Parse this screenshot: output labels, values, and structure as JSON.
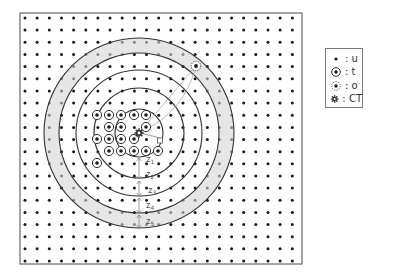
{
  "diagram": {
    "frame": {
      "x": 20,
      "y": 13,
      "width": 282,
      "height": 251
    },
    "grid": {
      "x0": 25,
      "y0": 18,
      "dx": 12.15,
      "dy": 12.15,
      "cols": 23,
      "rows": 21,
      "dot_color": "#1a1a1a"
    },
    "ct": {
      "x": 139,
      "y": 133
    },
    "rings": {
      "center": {
        "x": 139,
        "y": 133
      },
      "radii": [
        24,
        45,
        63,
        80,
        95
      ],
      "gray_band": {
        "inner": 80,
        "outer": 95,
        "color": "#e6e6e6"
      },
      "stroke_color": "#333333"
    },
    "t_markers": [
      [
        97,
        115
      ],
      [
        109,
        115
      ],
      [
        121,
        115
      ],
      [
        134,
        115
      ],
      [
        146,
        115
      ],
      [
        109,
        127
      ],
      [
        121,
        127
      ],
      [
        146,
        127
      ],
      [
        97,
        139
      ],
      [
        109,
        139
      ],
      [
        121,
        139
      ],
      [
        134,
        139
      ],
      [
        109,
        151
      ],
      [
        121,
        151
      ],
      [
        134,
        151
      ],
      [
        146,
        151
      ],
      [
        158,
        151
      ],
      [
        97,
        163
      ]
    ],
    "o_marker": {
      "x": 196,
      "y": 66
    },
    "d_box": {
      "x": 160,
      "y": 141,
      "label": "d"
    },
    "z_labels": [
      {
        "text": "z1",
        "x": 146,
        "y": 162
      },
      {
        "text": "z2",
        "x": 146,
        "y": 177
      },
      {
        "text": "z3",
        "x": 148,
        "y": 193
      },
      {
        "text": "z4",
        "x": 146,
        "y": 208
      },
      {
        "text": "z5",
        "x": 146,
        "y": 224
      }
    ],
    "z_arrows": [
      [
        157,
        180
      ],
      [
        180,
        197
      ],
      [
        197,
        214
      ],
      [
        214,
        229
      ]
    ],
    "z_arrow_x": 139
  },
  "legend": {
    "items": [
      {
        "icon": "u-dot-icon",
        "label": ": u"
      },
      {
        "icon": "t-ringed-dot-icon",
        "label": ": t"
      },
      {
        "icon": "o-dotted-ring-icon",
        "label": ": o"
      },
      {
        "icon": "ct-gear-icon",
        "label": ": CT"
      }
    ]
  }
}
